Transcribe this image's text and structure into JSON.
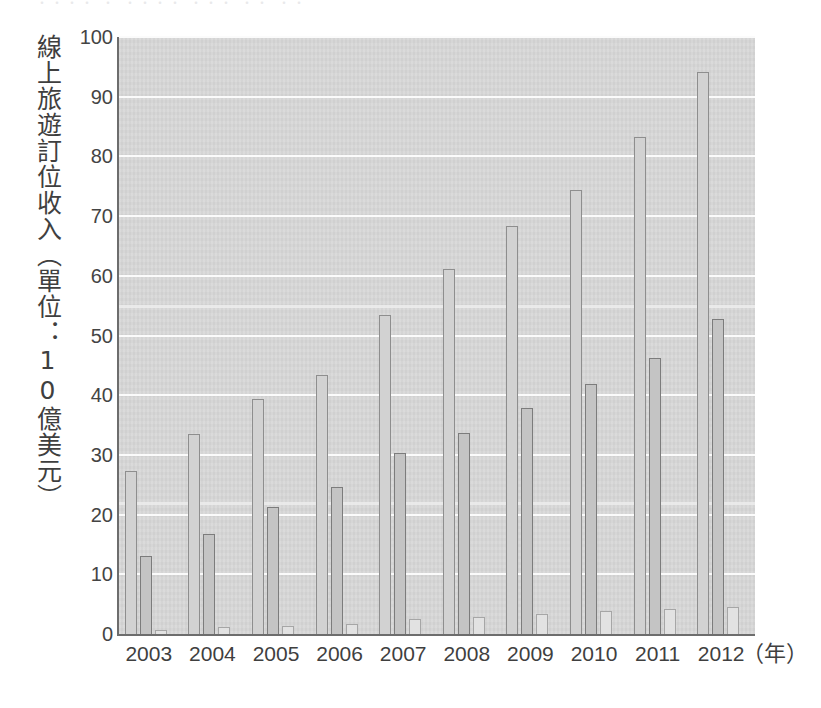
{
  "page": {
    "top_clipped_text": "・・・・ ・ ・・・・ ・・・ ・・ ・・"
  },
  "chart_data": {
    "type": "bar",
    "title": "",
    "subtitle": "",
    "xlabel": "（年）",
    "ylabel": "線上旅遊訂位收入（單位：10億美元）",
    "categories": [
      "2003",
      "2004",
      "2005",
      "2006",
      "2007",
      "2008",
      "2009",
      "2010",
      "2011",
      "2012"
    ],
    "series": [
      {
        "name": "series-1",
        "color": "#d2d2d2",
        "border_color": "#8e8e8e",
        "values": [
          27.3,
          33.5,
          39.3,
          43.4,
          53.4,
          61.2,
          68.3,
          74.3,
          83.3,
          94.2
        ]
      },
      {
        "name": "series-2",
        "color": "#c4c4c4",
        "border_color": "#7c7c7c",
        "values": [
          13.0,
          16.8,
          21.2,
          24.6,
          30.4,
          33.7,
          37.8,
          41.8,
          46.2,
          52.7
        ]
      },
      {
        "name": "series-3",
        "color": "#e2e2e2",
        "border_color": "#a6a6a6",
        "values": [
          0.6,
          1.1,
          1.3,
          1.6,
          2.5,
          2.9,
          3.4,
          3.9,
          4.2,
          4.5
        ]
      }
    ],
    "ylim": [
      0,
      100
    ],
    "yticks": [
      "0",
      "10",
      "20",
      "30",
      "40",
      "50",
      "60",
      "70",
      "80",
      "90",
      "100"
    ],
    "grid": true,
    "legend": "none",
    "plot_background": "#d7d7d7",
    "gridline_color": "#fbfbfb",
    "axis_color": "#6d6d6d"
  }
}
